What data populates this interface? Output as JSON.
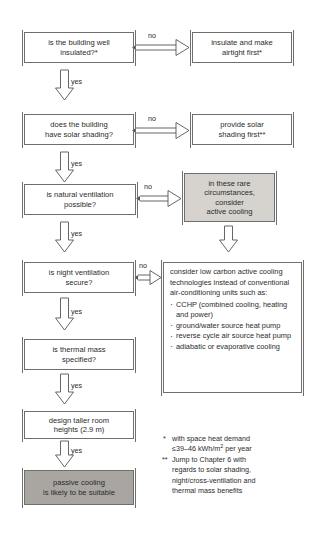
{
  "diagram": {
    "type": "flowchart",
    "colors": {
      "line": "#6f6f6f",
      "text": "#2b2b2b",
      "gray_light_fill": "#d6d3ce",
      "gray_dark_fill": "#a9a6a1",
      "background": "#ffffff"
    },
    "nodes": [
      {
        "id": "q1",
        "label": "is the building well\ninsulated?*"
      },
      {
        "id": "a1",
        "label": "insulate and make\nairtight first*"
      },
      {
        "id": "q2",
        "label": "does the building\nhave solar shading?"
      },
      {
        "id": "a2",
        "label": "provide solar\nshading first**"
      },
      {
        "id": "q3",
        "label": "is natural ventilation\npossible?"
      },
      {
        "id": "a3",
        "label": "in these rare\ncircumstances,\nconsider\nactive cooling"
      },
      {
        "id": "q4",
        "label": "is night ventilation\nsecure?"
      },
      {
        "id": "q5",
        "label": "is thermal mass\nspecified?"
      },
      {
        "id": "q6",
        "label": "design taller room\nheights (2.9 m)"
      },
      {
        "id": "end",
        "label": "passive cooling\nis likely to be suitable"
      }
    ],
    "textblock": {
      "intro": "consider low carbon active cooling technologies instead of conventional air-conditioning units such as:",
      "items": [
        "CCHP (combined cooling, heating and power)",
        "ground/water source heat pump",
        "reverse cycle air source heat pump",
        "adiabatic or evaporative cooling"
      ]
    },
    "edge_labels": {
      "no1": "no",
      "no2": "no",
      "no3": "no",
      "no4": "no",
      "yes1": "yes",
      "yes2": "yes",
      "yes3": "yes",
      "yes4": "yes",
      "yes5": "yes"
    },
    "footnotes": [
      {
        "mark": "*",
        "line1": "with space heat demand",
        "line2_pre": "≤39–46 kWh/m",
        "line2_sup": "2",
        "line2_post": " per year"
      },
      {
        "mark": "**",
        "line1": "Jump to Chapter 6 with",
        "line2": "regards to solar shading,",
        "line3": "night/cross-ventilation and",
        "line4": "thermal mass benefits"
      }
    ]
  }
}
